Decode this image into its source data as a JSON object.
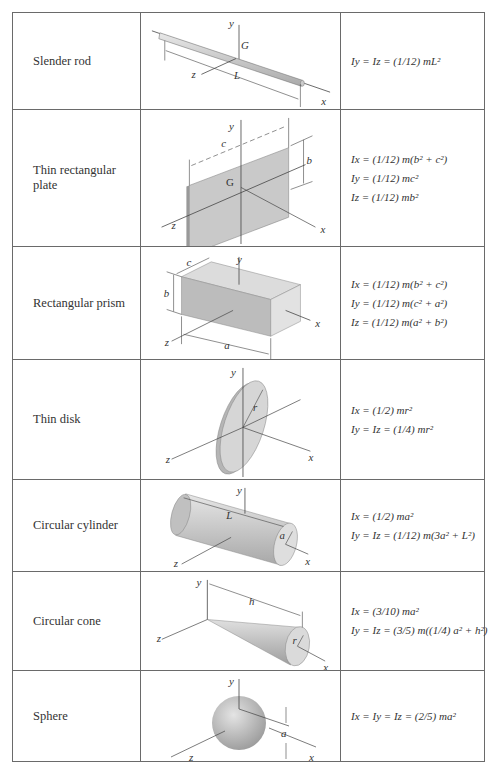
{
  "table": {
    "rows": [
      {
        "name": "Slender rod",
        "formulas": [
          "Iy = Iz = (1/12) mL²"
        ],
        "labels": {
          "y": "y",
          "G": "G",
          "z": "z",
          "L": "L",
          "x": "x"
        }
      },
      {
        "name": "Thin rectangular plate",
        "formulas": [
          "Ix = (1/12) m(b² + c²)",
          "Iy = (1/12) mc²",
          "Iz = (1/12) mb²"
        ],
        "labels": {
          "y": "y",
          "c": "c",
          "b": "b",
          "G": "G",
          "z": "z",
          "x": "x"
        }
      },
      {
        "name": "Rectangular prism",
        "formulas": [
          "Ix = (1/12) m(b² + c²)",
          "Iy = (1/12) m(c² + a²)",
          "Iz = (1/12) m(a² + b²)"
        ],
        "labels": {
          "y": "y",
          "c": "c",
          "b": "b",
          "z": "z",
          "a": "a",
          "x": "x"
        }
      },
      {
        "name": "Thin disk",
        "formulas": [
          "Ix = (1/2) mr²",
          "Iy = Iz = (1/4) mr²"
        ],
        "labels": {
          "y": "y",
          "r": "r",
          "z": "z",
          "x": "x"
        }
      },
      {
        "name": "Circular cylinder",
        "formulas": [
          "Ix = (1/2) ma²",
          "Iy = Iz = (1/12) m(3a² + L²)"
        ],
        "labels": {
          "y": "y",
          "L": "L",
          "a": "a",
          "z": "z",
          "x": "x"
        }
      },
      {
        "name": "Circular cone",
        "formulas": [
          "Ix = (3/10) ma²",
          "Iy = Iz = (3/5) m((1/4) a² + h²)"
        ],
        "labels": {
          "y": "y",
          "h": "h",
          "r": "r",
          "z": "z",
          "x": "x"
        }
      },
      {
        "name": "Sphere",
        "formulas": [
          "Ix = Iy = Iz = (2/5) ma²"
        ],
        "labels": {
          "y": "y",
          "a": "a",
          "z": "z",
          "x": "x"
        }
      }
    ]
  }
}
